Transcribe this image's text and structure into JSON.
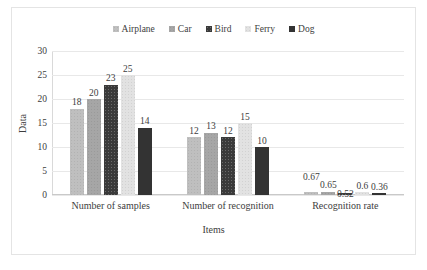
{
  "chart_data": {
    "type": "bar",
    "title": "",
    "xlabel": "Items",
    "ylabel": "Data",
    "categories": [
      "Number of samples",
      "Number of recognition",
      "Recognition rate"
    ],
    "series": [
      {
        "name": "Airplane",
        "color": "#bfbfbf",
        "values": [
          18,
          12,
          0.67
        ]
      },
      {
        "name": "Car",
        "color": "#a6a6a6",
        "values": [
          20,
          13,
          0.65
        ]
      },
      {
        "name": "Bird",
        "color": "#3a3a3a",
        "values": [
          23,
          12,
          0.52
        ]
      },
      {
        "name": "Ferry",
        "color": "#e2e2e2",
        "values": [
          25,
          15,
          0.6
        ]
      },
      {
        "name": "Dog",
        "color": "#333333",
        "values": [
          14,
          10,
          0.36
        ]
      }
    ],
    "value_labels": [
      [
        "18",
        "20",
        "23",
        "25",
        "14"
      ],
      [
        "12",
        "13",
        "12",
        "15",
        "10"
      ],
      [
        "0.67",
        "0.65",
        "0.52",
        "0.6",
        "0.36"
      ]
    ],
    "ylim": [
      0,
      30
    ],
    "yticks": [
      "0",
      "5",
      "10",
      "15",
      "20",
      "25",
      "30"
    ],
    "grid": true,
    "legend_position": "top-center"
  }
}
